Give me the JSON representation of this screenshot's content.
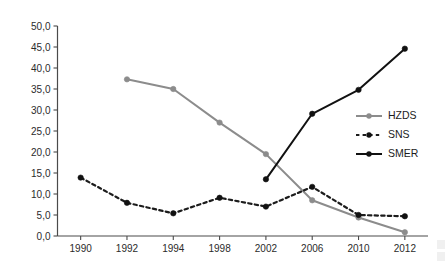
{
  "chart_data": {
    "type": "line",
    "title": "",
    "subtitle": "",
    "xlabel": "",
    "ylabel": "",
    "categories": [
      "1990",
      "1992",
      "1994",
      "1998",
      "2002",
      "2006",
      "2010",
      "2012"
    ],
    "ylim": [
      0,
      50
    ],
    "ytick_step": 5,
    "ytick_labels": [
      "0,0",
      "5,0",
      "10,0",
      "15,0",
      "20,0",
      "25,0",
      "30,0",
      "35,0",
      "40,0",
      "45,0",
      "50,0"
    ],
    "ytick_values": [
      0,
      5,
      10,
      15,
      20,
      25,
      30,
      35,
      40,
      45,
      50
    ],
    "grid": false,
    "legend_position": "right",
    "decimal_separator": ",",
    "series": [
      {
        "name": "HZDS",
        "color": "#8c8c8c",
        "style": "solid",
        "marker": "circle",
        "values": [
          null,
          37.3,
          35.0,
          27.0,
          19.5,
          8.5,
          4.4,
          0.9
        ]
      },
      {
        "name": "SNS",
        "color": "#1c1c1c",
        "style": "dashed",
        "marker": "circle",
        "values": [
          13.9,
          7.9,
          5.4,
          9.1,
          7.0,
          11.7,
          5.0,
          4.7
        ]
      },
      {
        "name": "SMER",
        "color": "#111111",
        "style": "solid",
        "marker": "circle",
        "values": [
          null,
          null,
          null,
          null,
          13.5,
          29.1,
          34.8,
          44.6
        ]
      }
    ]
  },
  "legend": {
    "items": [
      {
        "label": "HZDS"
      },
      {
        "label": "SNS"
      },
      {
        "label": "SMER"
      }
    ]
  },
  "axis": {
    "y_labels": [
      "50,0",
      "45,0",
      "40,0",
      "35,0",
      "30,0",
      "25,0",
      "20,0",
      "15,0",
      "10,0",
      "5,0",
      "0,0"
    ],
    "x_labels": [
      "1990",
      "1992",
      "1994",
      "1998",
      "2002",
      "2006",
      "2010",
      "2012"
    ]
  },
  "colors": {
    "hzds": "#8c8c8c",
    "sns": "#1c1c1c",
    "smer": "#111111",
    "axis": "#4a4a4a",
    "text": "#2b2b2b",
    "background": "#ffffff"
  }
}
